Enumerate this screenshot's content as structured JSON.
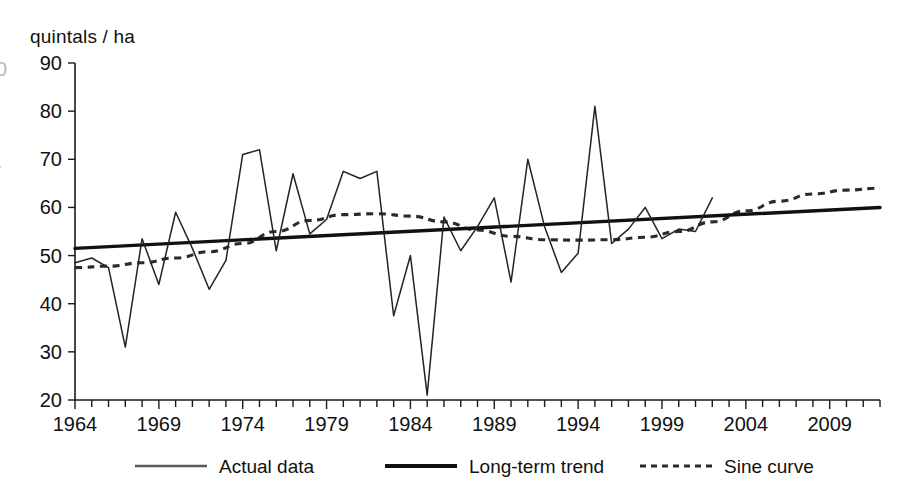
{
  "chart_data": {
    "type": "line",
    "title": "",
    "subtitle": "",
    "xlabel": "",
    "ylabel": "quintals / ha",
    "ylim": [
      20,
      90
    ],
    "xlim": [
      1964,
      2012
    ],
    "yticks": [
      20,
      30,
      40,
      50,
      60,
      70,
      80,
      90
    ],
    "xticks": [
      1964,
      1969,
      1974,
      1979,
      1984,
      1989,
      1994,
      1999,
      2004,
      2009
    ],
    "xtick_interval_minor": 1,
    "grid": false,
    "legend_position": "bottom",
    "x": [
      1964,
      1965,
      1966,
      1967,
      1968,
      1969,
      1970,
      1971,
      1972,
      1973,
      1974,
      1975,
      1976,
      1977,
      1978,
      1979,
      1980,
      1981,
      1982,
      1983,
      1984,
      1985,
      1986,
      1987,
      1988,
      1989,
      1990,
      1991,
      1992,
      1993,
      1994,
      1995,
      1996,
      1997,
      1998,
      1999,
      2000,
      2001,
      2002
    ],
    "series": [
      {
        "name": "Actual data",
        "style": "solid-thin",
        "color": "#232323",
        "x": [
          1964,
          1965,
          1966,
          1967,
          1968,
          1969,
          1970,
          1971,
          1972,
          1973,
          1974,
          1975,
          1976,
          1977,
          1978,
          1979,
          1980,
          1981,
          1982,
          1983,
          1984,
          1985,
          1986,
          1987,
          1988,
          1989,
          1990,
          1991,
          1992,
          1993,
          1994,
          1995,
          1996,
          1997,
          1998,
          1999,
          2000,
          2001,
          2002
        ],
        "values": [
          48.5,
          49.5,
          47.5,
          31.0,
          53.5,
          44.0,
          59.0,
          51.5,
          43.0,
          49.0,
          71.0,
          72.0,
          51.0,
          67.0,
          54.5,
          57.5,
          67.5,
          66.0,
          67.5,
          37.5,
          50.0,
          21.0,
          58.0,
          51.0,
          56.0,
          62.0,
          44.5,
          70.0,
          56.0,
          46.5,
          50.5,
          81.0,
          52.5,
          55.5,
          60.0,
          53.5,
          55.5,
          55.0,
          62.0
        ]
      },
      {
        "name": "Long-term trend",
        "style": "solid-thick",
        "color": "#111111",
        "x": [
          1964,
          2012
        ],
        "values": [
          51.5,
          60.0
        ]
      },
      {
        "name": "Sine curve",
        "style": "dashed",
        "color": "#2b2b2b",
        "x": [
          1964,
          1966,
          1968,
          1970,
          1972,
          1974,
          1976,
          1978,
          1980,
          1982,
          1984,
          1986,
          1988,
          1990,
          1992,
          1994,
          1996,
          1998,
          2000,
          2002,
          2004,
          2006,
          2008,
          2010,
          2012
        ],
        "values": [
          47.5,
          47.8,
          48.5,
          49.5,
          50.8,
          52.5,
          55.0,
          57.3,
          58.5,
          58.7,
          58.2,
          57.0,
          55.3,
          54.0,
          53.3,
          53.2,
          53.3,
          53.8,
          55.0,
          57.0,
          59.3,
          61.3,
          62.8,
          63.6,
          64.0
        ]
      }
    ]
  },
  "axis": {
    "y_title": "quintals / ha",
    "y_tick_labels": [
      "90",
      "80",
      "70",
      "60",
      "50",
      "40",
      "30",
      "20"
    ],
    "x_tick_labels": [
      "1964",
      "1969",
      "1974",
      "1979",
      "1984",
      "1989",
      "1994",
      "1999",
      "2004",
      "2009"
    ]
  },
  "legend": {
    "items": [
      {
        "label": "Actual data",
        "style": "solid-thin"
      },
      {
        "label": "Long-term trend",
        "style": "solid-thick"
      },
      {
        "label": "Sine curve",
        "style": "dashed"
      }
    ]
  },
  "artifacts": {
    "left_edge_mark_1": "0",
    "left_edge_mark_2": "."
  }
}
